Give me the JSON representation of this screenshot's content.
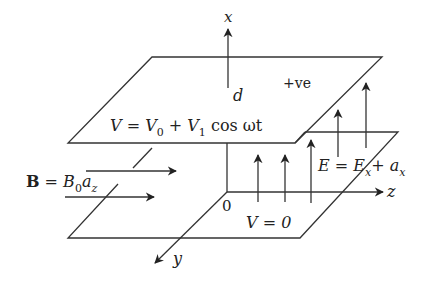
{
  "diagram": {
    "type": "parallel-plate-physics-diagram",
    "stroke_color": "#333333",
    "axes": {
      "x": {
        "label": "x"
      },
      "y": {
        "label": "y"
      },
      "z": {
        "label": "z"
      },
      "origin_label": "0",
      "separation_label": "d"
    },
    "top_plate": {
      "potential_lhs": "V = V",
      "potential_sub0": "0",
      "potential_mid": " + V",
      "potential_sub1": "1",
      "potential_rhs": " cos ωt",
      "charge_label": "+ve"
    },
    "bottom_plate": {
      "potential": "V = 0"
    },
    "magnetic_field": {
      "lhs": "B",
      "eq": " = B",
      "sub0": "0",
      "a": "a",
      "suba": "z"
    },
    "electric_field": {
      "lhs": "E = E",
      "subx": "x",
      "plus": "+ a",
      "suba": "x"
    }
  }
}
